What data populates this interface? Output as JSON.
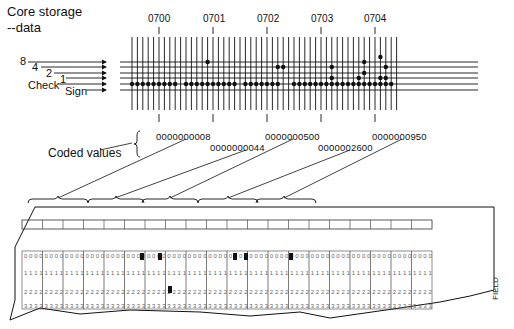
{
  "diagram": {
    "title_line1": "Core storage",
    "title_line2": "--data",
    "bit_labels": [
      "8",
      "4",
      "2",
      "1",
      "Check",
      "Sign"
    ],
    "addresses": [
      "0700",
      "0701",
      "0702",
      "0703",
      "0704"
    ],
    "coded_values_label": "Coded values",
    "coded_values": [
      "0000000008",
      "0000000044",
      "0000000500",
      "0000002600",
      "0000000950"
    ],
    "card_field_values": [
      "8",
      "44",
      "500",
      "2600",
      "950"
    ],
    "card_side_label": "FIELD",
    "card_row_digits": [
      "0",
      "1",
      "2",
      "3"
    ],
    "card_columns": 80,
    "colors": {
      "ink": "#111111",
      "card_ink": "#555555",
      "background": "#ffffff"
    }
  }
}
